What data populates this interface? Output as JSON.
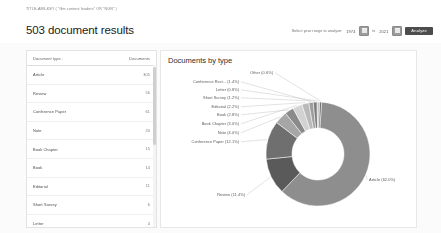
{
  "breadcrumb": {
    "query": "TITLE-ABS-KEY ( \"film content leaders\"  OR  \"NGN\" )"
  },
  "header": {
    "title": "503 document results",
    "range_label": "Select year range to analyze:",
    "year_from": "1974",
    "year_to": "2021",
    "to_word": "to",
    "analyze_label": "Analyze",
    "calendar_icon_from": "calendar-icon",
    "calendar_icon_to": "calendar-icon"
  },
  "table": {
    "columns": [
      "Document type",
      "Documents"
    ],
    "sort_glyph": "↓",
    "rows": [
      {
        "type": "Article",
        "count": "305"
      },
      {
        "type": "Review",
        "count": "56"
      },
      {
        "type": "Conference Paper",
        "count": "61"
      },
      {
        "type": "Note",
        "count": "20"
      },
      {
        "type": "Book Chapter",
        "count": "15"
      },
      {
        "type": "Book",
        "count": "14"
      },
      {
        "type": "Editorial",
        "count": "11"
      },
      {
        "type": "Short Survey",
        "count": "6"
      },
      {
        "type": "Letter",
        "count": "4"
      },
      {
        "type": "Conference Review",
        "count": "7"
      }
    ]
  },
  "chart": {
    "title": "Documents by type"
  },
  "chart_data": {
    "type": "pie",
    "title": "Documents by type",
    "donut": true,
    "legend": "none",
    "labels_mode": "leader-lines",
    "categories": [
      "Article",
      "Conference Paper",
      "Review",
      "Note",
      "Book Chapter",
      "Book",
      "Editorial",
      "Short Survey",
      "Conference Revi...",
      "Letter",
      "Other"
    ],
    "values": [
      62.0,
      12.1,
      11.4,
      4.0,
      3.0,
      2.8,
      2.2,
      1.2,
      1.4,
      0.8,
      0.6
    ],
    "unit": "%",
    "point_labels": [
      "Article (62.0%)",
      "Conference Paper   (12.1%)",
      "Review (11.4%)",
      "Note (4.0%)",
      "Book Chapter (3.0%)",
      "Book (2.8%)",
      "Editorial (2.2%)",
      "Short Survey (1.2%)",
      "Conference Revi...   (1.4%)",
      "Letter (0.8%)",
      "Other (0.6%)"
    ],
    "colors": [
      "#8e8e8e",
      "#6f6f6f",
      "#5a5a5a",
      "#a6a6a6",
      "#d2d2d2",
      "#8a8a8a",
      "#b9b9b9",
      "#7c7c7c",
      "#9d9d9d",
      "#c6c6c6",
      "#6a6a6a"
    ]
  }
}
